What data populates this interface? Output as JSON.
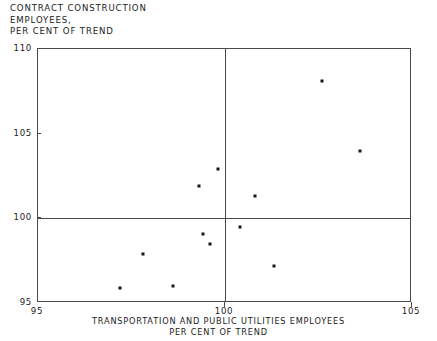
{
  "chart_data": {
    "type": "scatter",
    "title": "",
    "title_lines": [
      "CONTRACT CONSTRUCTION",
      "EMPLOYEES,",
      "PER CENT OF TREND"
    ],
    "ylabel_lines": [
      "CONTRACT CONSTRUCTION",
      "EMPLOYEES,",
      "PER CENT OF TREND"
    ],
    "xlabel_lines": [
      "TRANSPORTATION AND PUBLIC UTILITIES EMPLOYEES",
      "PER CENT OF TREND"
    ],
    "xlabel": "TRANSPORTATION AND PUBLIC UTILITIES EMPLOYEES PER CENT OF TREND",
    "ylabel": "CONTRACT CONSTRUCTION EMPLOYEES, PER CENT OF TREND",
    "xlim": [
      95,
      105
    ],
    "ylim": [
      95,
      110
    ],
    "xticks": [
      95,
      100,
      105
    ],
    "yticks": [
      95,
      100,
      105,
      110
    ],
    "xtick_labels": [
      "95",
      "100",
      "105"
    ],
    "ytick_labels": [
      "95",
      "100",
      "105",
      "110"
    ],
    "grid": false,
    "legend": null,
    "reference_lines": {
      "horizontal": 100,
      "vertical": 100
    },
    "marker_color": "#161616",
    "axis_color": "#4a4a4a",
    "background_color": "#ffffff",
    "x": [
      97.2,
      97.8,
      98.6,
      99.3,
      99.4,
      99.6,
      99.8,
      100.4,
      100.8,
      101.3,
      102.6,
      103.6
    ],
    "y": [
      95.9,
      97.9,
      96.0,
      101.9,
      99.1,
      98.5,
      102.9,
      99.5,
      101.3,
      97.2,
      108.1,
      104.0
    ],
    "points": [
      {
        "x": 97.2,
        "y": 95.9
      },
      {
        "x": 97.8,
        "y": 97.9
      },
      {
        "x": 98.6,
        "y": 96.0
      },
      {
        "x": 99.3,
        "y": 101.9
      },
      {
        "x": 99.4,
        "y": 99.1
      },
      {
        "x": 99.6,
        "y": 98.5
      },
      {
        "x": 99.8,
        "y": 102.9
      },
      {
        "x": 100.4,
        "y": 99.5
      },
      {
        "x": 100.8,
        "y": 101.3
      },
      {
        "x": 101.3,
        "y": 97.2
      },
      {
        "x": 102.6,
        "y": 108.1
      },
      {
        "x": 103.6,
        "y": 104.0
      }
    ]
  }
}
